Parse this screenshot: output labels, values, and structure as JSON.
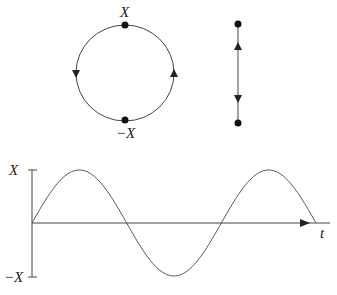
{
  "diagram": {
    "circle": {
      "top_label": "X",
      "bottom_label": "−X",
      "direction": "counterclockwise",
      "center": [
        125,
        73
      ],
      "radius": [
        49,
        48
      ]
    },
    "segment": {
      "x": 238,
      "y_top": 24,
      "y_bottom": 123
    },
    "wave": {
      "y_max_label": "X",
      "y_min_label": "−X",
      "x_axis_label": "t",
      "periods": 1.5,
      "origin": [
        32,
        223
      ],
      "amplitude_px": 53,
      "x_end": 316
    },
    "colors": {
      "stroke": "#444444",
      "dot": "#111111"
    }
  }
}
